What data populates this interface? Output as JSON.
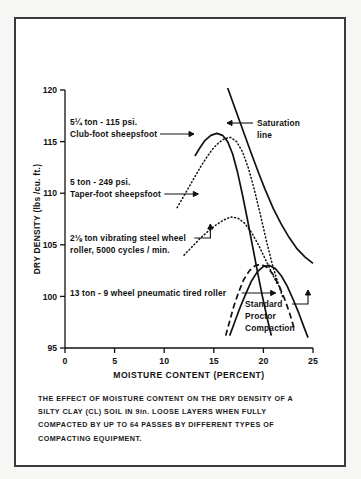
{
  "figure": {
    "caption_lines": [
      "THE EFFECT OF MOISTURE CONTENT ON THE DRY DENSITY OF A",
      "SILTY CLAY (CL) SOIL IN 9in. LOOSE LAYERS WHEN FULLY",
      "COMPACTED BY UP TO 64 PASSES BY DIFFERENT TYPES OF",
      "COMPACTING EQUIPMENT."
    ]
  },
  "chart_data": {
    "type": "line",
    "title": "",
    "xlabel": "MOISTURE CONTENT (PERCENT)",
    "ylabel": "DRY DENSITY (lbs /cu. ft.)",
    "xlim": [
      0,
      25
    ],
    "ylim": [
      95,
      120
    ],
    "xticks": [
      0,
      5,
      10,
      15,
      20,
      25
    ],
    "xticklabels": [
      "0",
      "5",
      "10",
      "15",
      "20",
      "25"
    ],
    "yticks": [
      95,
      100,
      105,
      110,
      115,
      120
    ],
    "yticklabels": [
      "95",
      "100",
      "105",
      "110",
      "115",
      "120"
    ],
    "grid": false,
    "legend": "inline-annotations",
    "series": [
      {
        "name": "5¼ ton - 115 psi. Club-foot sheepsfoot",
        "style": "solid",
        "points": [
          [
            13.1,
            113.6
          ],
          [
            13.6,
            114.4
          ],
          [
            14.1,
            115.1
          ],
          [
            14.7,
            115.6
          ],
          [
            15.3,
            115.8
          ],
          [
            15.9,
            115.6
          ],
          [
            16.4,
            115.0
          ],
          [
            16.9,
            113.8
          ],
          [
            17.4,
            112.0
          ],
          [
            17.9,
            109.8
          ],
          [
            18.4,
            107.4
          ],
          [
            18.9,
            104.9
          ],
          [
            19.4,
            102.4
          ],
          [
            19.9,
            100.0
          ],
          [
            20.4,
            97.8
          ],
          [
            20.8,
            96.2
          ]
        ]
      },
      {
        "name": "5 ton - 249 psi. Taper-foot sheepsfoot",
        "style": "dotted",
        "points": [
          [
            11.3,
            108.6
          ],
          [
            11.9,
            109.6
          ],
          [
            12.5,
            110.6
          ],
          [
            13.1,
            111.6
          ],
          [
            13.7,
            112.6
          ],
          [
            14.3,
            113.5
          ],
          [
            14.9,
            114.3
          ],
          [
            15.5,
            114.9
          ],
          [
            16.1,
            115.3
          ],
          [
            16.7,
            115.4
          ],
          [
            17.3,
            115.0
          ],
          [
            17.9,
            114.0
          ],
          [
            18.5,
            112.4
          ],
          [
            19.1,
            110.3
          ],
          [
            19.7,
            107.9
          ],
          [
            20.3,
            105.4
          ],
          [
            20.9,
            103.1
          ],
          [
            21.5,
            101.2
          ],
          [
            22.0,
            99.8
          ]
        ]
      },
      {
        "name": "2⅛ ton vibrating steel wheel roller, 5000 cycles / min.",
        "style": "dotted",
        "points": [
          [
            12.0,
            104.0
          ],
          [
            12.8,
            104.8
          ],
          [
            13.6,
            105.6
          ],
          [
            14.4,
            106.3
          ],
          [
            15.2,
            106.9
          ],
          [
            16.0,
            107.4
          ],
          [
            16.7,
            107.7
          ],
          [
            17.4,
            107.6
          ],
          [
            18.1,
            107.1
          ],
          [
            18.8,
            106.2
          ],
          [
            19.5,
            105.0
          ],
          [
            20.2,
            103.6
          ],
          [
            20.9,
            102.2
          ],
          [
            21.4,
            101.2
          ]
        ]
      },
      {
        "name": "13 ton - 9 wheel pneumatic tired roller",
        "style": "dashed",
        "points": [
          [
            16.2,
            96.2
          ],
          [
            16.6,
            97.6
          ],
          [
            17.0,
            99.0
          ],
          [
            17.5,
            100.4
          ],
          [
            18.0,
            101.6
          ],
          [
            18.6,
            102.5
          ],
          [
            19.2,
            103.0
          ],
          [
            19.8,
            103.1
          ],
          [
            20.4,
            102.8
          ],
          [
            21.0,
            102.1
          ],
          [
            21.6,
            101.0
          ],
          [
            22.2,
            99.6
          ],
          [
            22.7,
            98.2
          ],
          [
            23.1,
            96.9
          ]
        ]
      },
      {
        "name": "Standard Proctor Compaction",
        "style": "solid",
        "points": [
          [
            16.6,
            96.2
          ],
          [
            17.1,
            97.5
          ],
          [
            17.6,
            98.8
          ],
          [
            18.2,
            100.2
          ],
          [
            18.8,
            101.5
          ],
          [
            19.4,
            102.4
          ],
          [
            20.0,
            102.9
          ],
          [
            20.6,
            103.0
          ],
          [
            21.2,
            102.7
          ],
          [
            21.8,
            102.0
          ],
          [
            22.4,
            101.0
          ],
          [
            23.0,
            99.7
          ],
          [
            23.6,
            98.3
          ],
          [
            24.1,
            97.0
          ],
          [
            24.5,
            96.0
          ]
        ]
      },
      {
        "name": "Saturation line",
        "style": "solid",
        "points": [
          [
            16.4,
            120.2
          ],
          [
            17.0,
            118.6
          ],
          [
            17.6,
            117.0
          ],
          [
            18.2,
            115.4
          ],
          [
            18.8,
            113.8
          ],
          [
            19.5,
            112.0
          ],
          [
            20.2,
            110.3
          ],
          [
            21.0,
            108.5
          ],
          [
            21.8,
            107.0
          ],
          [
            22.6,
            105.7
          ],
          [
            23.4,
            104.6
          ],
          [
            24.2,
            103.8
          ],
          [
            25.0,
            103.2
          ]
        ]
      }
    ],
    "annotations": [
      {
        "name": "club-foot-sheepsfoot",
        "lines": [
          "5¼ ton - 115 psi.",
          "Club-foot sheepsfoot"
        ],
        "text_x": 70,
        "text_y": 125,
        "leader": "arrow-right"
      },
      {
        "name": "taper-foot-sheepsfoot",
        "lines": [
          "5 ton - 249 psi.",
          "Taper-foot sheepsfoot"
        ],
        "text_x": 70,
        "text_y": 185,
        "leader": "arrow-right"
      },
      {
        "name": "vibrating-steel-wheel-roller",
        "lines": [
          "2⅛ ton vibrating steel wheel",
          "roller, 5000 cycles / min."
        ],
        "text_x": 70,
        "text_y": 241,
        "leader": "elbow-up"
      },
      {
        "name": "pneumatic-tired-roller",
        "lines": [
          "13 ton - 9 wheel pneumatic tired roller"
        ],
        "text_x": 70,
        "text_y": 296,
        "leader": "arrow-right"
      },
      {
        "name": "saturation-line",
        "lines": [
          "Saturation",
          "line"
        ],
        "text_x": 257,
        "text_y": 126,
        "leader": "arrow-left"
      },
      {
        "name": "standard-proctor-compaction",
        "lines": [
          "Standard",
          "Proctor",
          "Compaction"
        ],
        "text_x": 245,
        "text_y": 307,
        "leader": "elbow-up"
      }
    ]
  }
}
